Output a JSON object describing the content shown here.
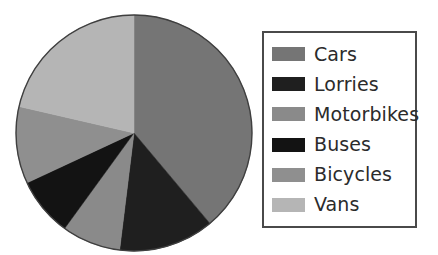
{
  "chart_data": {
    "type": "pie",
    "title": "",
    "subtitle": "",
    "xlabel": "",
    "ylabel": "",
    "grid": false,
    "legend_position": "right",
    "start_angle_deg": 0,
    "direction": "clockwise",
    "center": {
      "x": 134,
      "y": 133
    },
    "radius": 118,
    "outline_color": "#3f3f3f",
    "background": "#ffffff",
    "categories": [
      "Cars",
      "Lorries",
      "Motorbikes",
      "Buses",
      "Bicycles",
      "Vans"
    ],
    "values": [
      39,
      13,
      8,
      8,
      10,
      21
    ],
    "unit": "percent",
    "slices": [
      {
        "label": "Cars",
        "value": 39,
        "color": "#757575",
        "start_deg": 0,
        "end_deg": 140
      },
      {
        "label": "Lorries",
        "value": 13,
        "color": "#1f1f1f",
        "start_deg": 140,
        "end_deg": 187
      },
      {
        "label": "Motorbikes",
        "value": 8,
        "color": "#8a8a8a",
        "start_deg": 187,
        "end_deg": 216
      },
      {
        "label": "Buses",
        "value": 8,
        "color": "#131313",
        "start_deg": 216,
        "end_deg": 245
      },
      {
        "label": "Bicycles",
        "value": 10,
        "color": "#8f8f8f",
        "start_deg": 245,
        "end_deg": 283
      },
      {
        "label": "Vans",
        "value": 21,
        "color": "#b5b5b5",
        "start_deg": 283,
        "end_deg": 360
      }
    ],
    "annotations": []
  },
  "legend": {
    "border_color": "#4a4a4a",
    "items": [
      {
        "label": "Cars",
        "color": "#757575"
      },
      {
        "label": "Lorries",
        "color": "#1f1f1f"
      },
      {
        "label": "Motorbikes",
        "color": "#8a8a8a"
      },
      {
        "label": "Buses",
        "color": "#131313"
      },
      {
        "label": "Bicycles",
        "color": "#8f8f8f"
      },
      {
        "label": "Vans",
        "color": "#b5b5b5"
      }
    ]
  }
}
